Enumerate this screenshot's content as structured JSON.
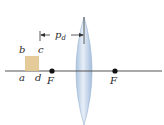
{
  "diagram": {
    "type": "optics-thin-lens",
    "object": {
      "shape": "square",
      "color": "#e2c48f",
      "corners": {
        "top_left": "b",
        "top_right": "c",
        "bottom_left": "a",
        "bottom_right": "d"
      }
    },
    "focal_points": [
      {
        "label": "F",
        "side": "left"
      },
      {
        "label": "F",
        "side": "right"
      }
    ],
    "distance_label": {
      "main": "p",
      "subscript": "d"
    },
    "lens": {
      "type": "converging",
      "color": "#bcd3ea"
    },
    "colors": {
      "axis": "#555555",
      "dots": "#111111",
      "text": "#2b2b2b"
    }
  }
}
